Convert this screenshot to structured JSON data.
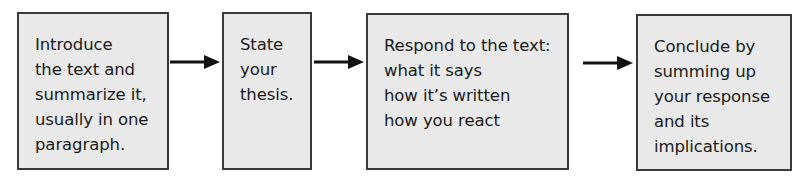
{
  "diagram": {
    "type": "flowchart",
    "direction": "left-to-right",
    "colors": {
      "box_fill": "#e9e9e9",
      "box_border": "#3a3a3a",
      "arrow": "#111111",
      "text": "#1a1a1a"
    },
    "steps": [
      {
        "id": "introduce",
        "lines": [
          "Introduce",
          "the text and",
          "summarize it,",
          "usually in one",
          "paragraph."
        ]
      },
      {
        "id": "thesis",
        "lines": [
          "State",
          "your",
          "thesis."
        ]
      },
      {
        "id": "respond",
        "lines": [
          "Respond to the text:",
          "what it says",
          "how it’s written",
          "how you react"
        ]
      },
      {
        "id": "conclude",
        "lines": [
          "Conclude by",
          "summing up",
          "your response",
          "and its",
          "implications."
        ]
      }
    ],
    "edges": [
      {
        "from": "introduce",
        "to": "thesis"
      },
      {
        "from": "thesis",
        "to": "respond"
      },
      {
        "from": "respond",
        "to": "conclude"
      }
    ]
  }
}
